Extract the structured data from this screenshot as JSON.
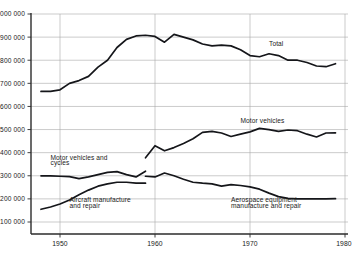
{
  "chart_data": {
    "type": "line",
    "title": "",
    "subtitle": "",
    "xlabel": "",
    "ylabel": "",
    "xlim": [
      1948,
      1980
    ],
    "ylim": [
      100000,
      1000000
    ],
    "grid": true,
    "legend_position": "inline-annotations",
    "x_ticks": [
      "1950",
      "1960",
      "1970",
      "1980"
    ],
    "x_tick_values": [
      1950,
      1960,
      1970,
      1980
    ],
    "y_ticks": [
      "100 000",
      "200 000",
      "300 000",
      "400 000",
      "500 000",
      "600 000",
      "700 000",
      "800 000",
      "900 000",
      "1 000 000"
    ],
    "y_tick_values": [
      100000,
      200000,
      300000,
      400000,
      500000,
      600000,
      700000,
      800000,
      900000,
      1000000
    ],
    "series": [
      {
        "name": "Total",
        "label": "Total",
        "x": [
          1948,
          1949,
          1950,
          1951,
          1952,
          1953,
          1954,
          1955,
          1956,
          1957,
          1958,
          1959,
          1960,
          1961,
          1962,
          1963,
          1964,
          1965,
          1966,
          1967,
          1968,
          1969,
          1970,
          1971,
          1972,
          1973,
          1974,
          1975,
          1976,
          1977,
          1978,
          1979
        ],
        "values": [
          665000,
          665000,
          672000,
          700000,
          712000,
          730000,
          770000,
          800000,
          855000,
          890000,
          905000,
          908000,
          903000,
          878000,
          912000,
          900000,
          888000,
          870000,
          862000,
          865000,
          862000,
          845000,
          820000,
          815000,
          828000,
          820000,
          800000,
          800000,
          790000,
          775000,
          772000,
          785000
        ]
      },
      {
        "name": "Motor vehicles and cycles",
        "label": "Motor vehicles and cycles",
        "x": [
          1948,
          1949,
          1950,
          1951,
          1952,
          1953,
          1954,
          1955,
          1956,
          1957,
          1958,
          1959
        ],
        "values": [
          300000,
          300000,
          298000,
          296000,
          288000,
          295000,
          305000,
          315000,
          318000,
          305000,
          295000,
          320000
        ]
      },
      {
        "name": "Motor vehicles",
        "label": "Motor vehicles",
        "x": [
          1959,
          1960,
          1961,
          1962,
          1963,
          1964,
          1965,
          1966,
          1967,
          1968,
          1969,
          1970,
          1971,
          1972,
          1973,
          1974,
          1975,
          1976,
          1977,
          1978,
          1979
        ],
        "values": [
          378000,
          430000,
          408000,
          422000,
          440000,
          460000,
          488000,
          492000,
          485000,
          470000,
          480000,
          490000,
          505000,
          500000,
          492000,
          498000,
          495000,
          480000,
          468000,
          485000,
          486000
        ]
      },
      {
        "name": "Aircraft manufacture and repair",
        "label": "Aircraft manufacture and repair",
        "x": [
          1948,
          1949,
          1950,
          1951,
          1952,
          1953,
          1954,
          1955,
          1956,
          1957,
          1958,
          1959
        ],
        "values": [
          155000,
          165000,
          178000,
          195000,
          218000,
          238000,
          255000,
          265000,
          272000,
          272000,
          268000,
          268000
        ]
      },
      {
        "name": "Aerospace equipment manufacture and repair",
        "label": "Aerospace equipment manufacture and repair",
        "x": [
          1959,
          1960,
          1961,
          1962,
          1963,
          1964,
          1965,
          1966,
          1967,
          1968,
          1969,
          1970,
          1971,
          1972,
          1973,
          1974,
          1975,
          1976,
          1977,
          1978,
          1979
        ],
        "values": [
          298000,
          295000,
          312000,
          300000,
          285000,
          272000,
          268000,
          265000,
          255000,
          262000,
          258000,
          252000,
          242000,
          225000,
          210000,
          202000,
          200000,
          200000,
          200000,
          200000,
          201000
        ]
      }
    ],
    "annotations": [
      {
        "id": "total",
        "text": "Total",
        "x": 1972,
        "y": 860000
      },
      {
        "id": "motor-vehicles",
        "text": "Motor vehicles",
        "x": 1969,
        "y": 530000
      },
      {
        "id": "motor-vehicles-and-cycles-line1",
        "text": "Motor vehicles and",
        "x": 1949,
        "y": 368000
      },
      {
        "id": "motor-vehicles-and-cycles-line2",
        "text": "cycles",
        "x": 1949,
        "y": 345000
      },
      {
        "id": "aircraft-line1",
        "text": "Aircraft manufacture",
        "x": 1951,
        "y": 185000
      },
      {
        "id": "aircraft-line2",
        "text": "and repair",
        "x": 1951,
        "y": 162000
      },
      {
        "id": "aerospace-line1",
        "text": "Aerospace equipment",
        "x": 1968,
        "y": 185000
      },
      {
        "id": "aerospace-line2",
        "text": "manufacture and repair",
        "x": 1968,
        "y": 162000
      }
    ],
    "colors": {
      "line": "#15161a",
      "grid": "#a8a8a8",
      "axis": "#2b2b2b",
      "background": "#ffffff",
      "text": "#1a1a1a"
    }
  }
}
